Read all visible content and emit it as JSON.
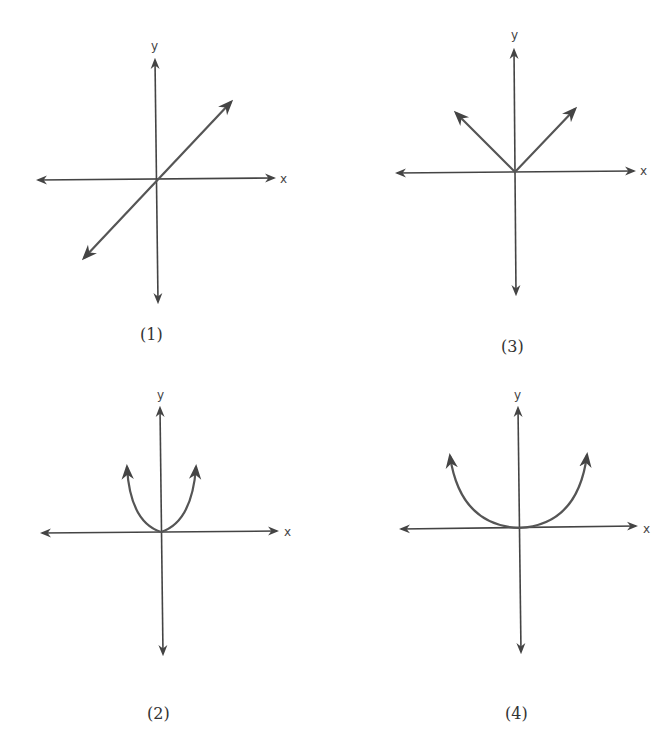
{
  "graphs": [
    {
      "caption": "(1)",
      "x_label": "x",
      "y_label": "y",
      "shape": "straight line through origin (y = x)"
    },
    {
      "caption": "(2)",
      "x_label": "x",
      "y_label": "y",
      "shape": "narrow upward parabola with vertex at origin"
    },
    {
      "caption": "(3)",
      "x_label": "x",
      "y_label": "y",
      "shape": "V shape (absolute value) with vertex at origin"
    },
    {
      "caption": "(4)",
      "x_label": "x",
      "y_label": "y",
      "shape": "wide upward parabola with vertex at origin"
    }
  ],
  "colors": {
    "axis": "#444444",
    "curve": "#555555",
    "background": "#ffffff"
  }
}
